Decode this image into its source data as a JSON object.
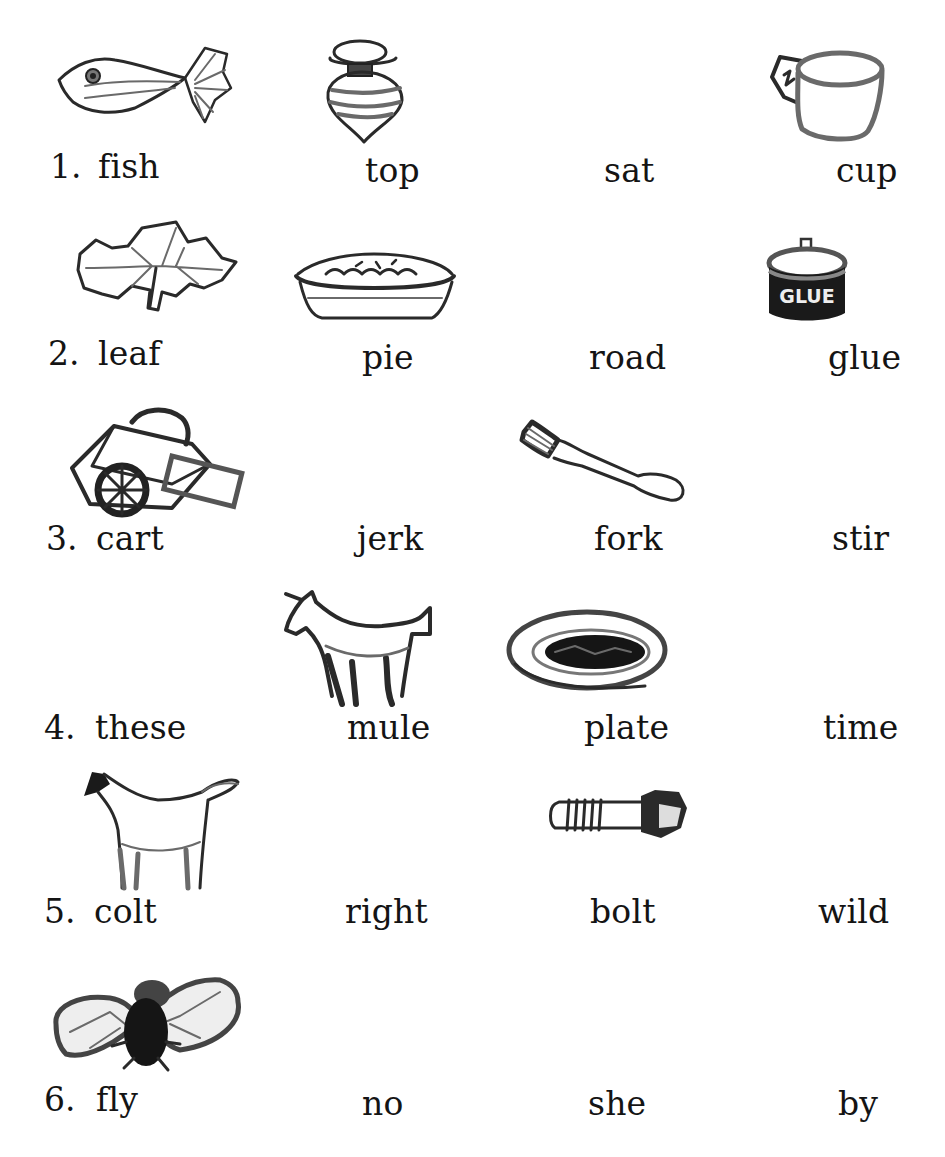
{
  "worksheet": {
    "rows": [
      {
        "number": "1.",
        "words": [
          "fish",
          "top",
          "sat",
          "cup"
        ],
        "pictures": [
          "fish-icon",
          "spinning-top-icon",
          null,
          "cup-icon"
        ]
      },
      {
        "number": "2.",
        "words": [
          "leaf",
          "pie",
          "road",
          "glue"
        ],
        "pictures": [
          "leaf-icon",
          "pie-icon",
          null,
          "glue-jar-icon"
        ],
        "glue_label": "GLUE"
      },
      {
        "number": "3.",
        "words": [
          "cart",
          "jerk",
          "fork",
          "stir"
        ],
        "pictures": [
          "cart-icon",
          null,
          "fork-icon",
          null
        ]
      },
      {
        "number": "4.",
        "words": [
          "these",
          "mule",
          "plate",
          "time"
        ],
        "pictures": [
          null,
          "mule-icon",
          "plate-icon",
          null
        ]
      },
      {
        "number": "5.",
        "words": [
          "colt",
          "right",
          "bolt",
          "wild"
        ],
        "pictures": [
          "colt-icon",
          null,
          "bolt-icon",
          null
        ]
      },
      {
        "number": "6.",
        "words": [
          "fly",
          "no",
          "she",
          "by"
        ],
        "pictures": [
          "fly-icon",
          null,
          null,
          null
        ]
      }
    ],
    "colors": {
      "text": "#141414",
      "background": "#ffffff",
      "sketch": "#2a2a2a"
    }
  }
}
